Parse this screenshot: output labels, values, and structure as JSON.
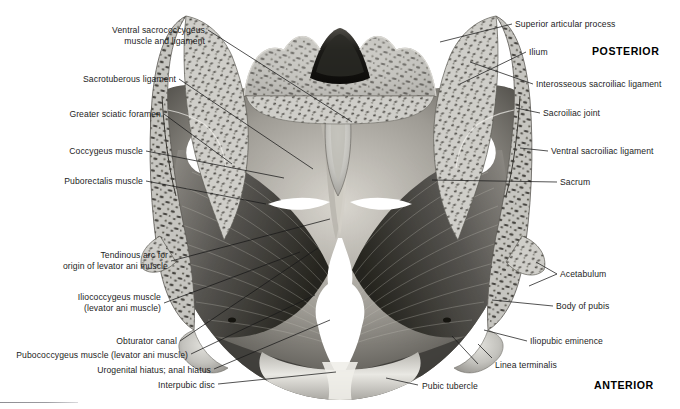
{
  "figure": {
    "type": "anatomical-illustration",
    "style": "grayscale medical illustration",
    "orientation": {
      "top_label": "POSTERIOR",
      "bottom_label": "ANTERIOR"
    },
    "colors": {
      "background": "#ffffff",
      "bone_light": "#c9c8c3",
      "bone_mid": "#9a9893",
      "bone_dark": "#4a4845",
      "muscle_dark": "#2a2927",
      "muscle_mid": "#6d6b67",
      "muscle_light": "#b4b1ab",
      "hiatus_white": "#ffffff",
      "leader_line": "#1a1a1a",
      "text": "#1d1d1d"
    },
    "labels_left": [
      {
        "text": "Ventral sacrococcygeus\nmuscle and ligament",
        "x": 205,
        "y": 22,
        "lines": 2
      },
      {
        "text": "Sacrotuberous ligament",
        "x": 176,
        "y": 75,
        "lines": 1
      },
      {
        "text": "Greater sciatic foramen",
        "x": 161,
        "y": 110,
        "lines": 1
      },
      {
        "text": "Coccygeus muscle",
        "x": 143,
        "y": 147,
        "lines": 1
      },
      {
        "text": "Puborectalis muscle",
        "x": 143,
        "y": 177,
        "lines": 1
      },
      {
        "text": "Tendinous arc for\norigin of levator ani muscle",
        "x": 168,
        "y": 255,
        "lines": 2
      },
      {
        "text": "Iliococcygeus muscle\n(levator ani muscle)",
        "x": 161,
        "y": 297,
        "lines": 2
      },
      {
        "text": "Obturator canal",
        "x": 177,
        "y": 337,
        "lines": 1
      },
      {
        "text": "Pubococcygeus muscle (levator ani muscle)",
        "x": 188,
        "y": 351,
        "lines": 1
      },
      {
        "text": "Urogenital hiatus; anal hiatus",
        "x": 211,
        "y": 366,
        "lines": 1
      },
      {
        "text": "Interpubic disc",
        "x": 215,
        "y": 381,
        "lines": 1
      }
    ],
    "labels_right": [
      {
        "text": "Superior articular process",
        "x": 515,
        "y": 20
      },
      {
        "text": "Ilium",
        "x": 529,
        "y": 48
      },
      {
        "text": "Interosseous sacroiliac ligament",
        "x": 536,
        "y": 80
      },
      {
        "text": "Sacroiliac joint",
        "x": 543,
        "y": 109
      },
      {
        "text": "Ventral sacroiliac ligament",
        "x": 551,
        "y": 147
      },
      {
        "text": "Sacrum",
        "x": 560,
        "y": 178
      },
      {
        "text": "Acetabulum",
        "x": 560,
        "y": 270
      },
      {
        "text": "Body of pubis",
        "x": 556,
        "y": 302
      },
      {
        "text": "Iliopubic eminence",
        "x": 530,
        "y": 337
      },
      {
        "text": "Linea terminalis",
        "x": 478,
        "y": 361
      },
      {
        "text": "Pubic tubercle",
        "x": 422,
        "y": 382
      }
    ],
    "orientation_markers": [
      {
        "text": "POSTERIOR",
        "x": 592,
        "y": 45
      },
      {
        "text": "ANTERIOR",
        "x": 594,
        "y": 379
      }
    ],
    "structures_depicted": [
      "sacrum cross-section with trabecular bone",
      "ilium (cut) both sides",
      "sacral canal",
      "coccyx",
      "levator ani muscle sheet",
      "greater sciatic foramina",
      "urogenital and anal hiatus",
      "pubic symphysis / interpubic disc",
      "acetabulum (cut)"
    ]
  }
}
